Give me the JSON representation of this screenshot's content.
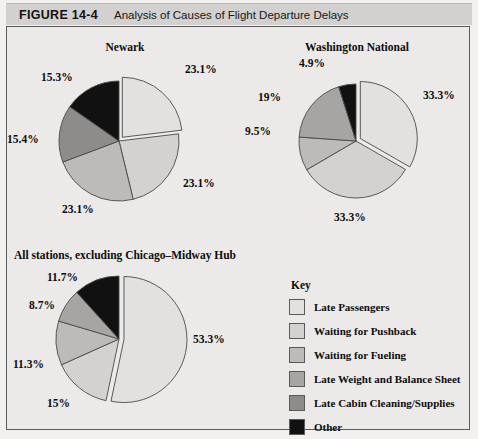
{
  "header": {
    "figure_number": "FIGURE 14-4",
    "title": "Analysis of Causes of Flight Departure Delays"
  },
  "legend": {
    "title": "Key",
    "items": [
      {
        "label": "Late Passengers",
        "color": "#e2e1df"
      },
      {
        "label": "Waiting for Pushback",
        "color": "#d3d2d0"
      },
      {
        "label": "Waiting for Fueling",
        "color": "#bcbbb9"
      },
      {
        "label": "Late Weight and Balance Sheet",
        "color": "#a6a5a3"
      },
      {
        "label": "Late Cabin Cleaning/Supplies",
        "color": "#8d8c8a"
      },
      {
        "label": "Other",
        "color": "#111111"
      }
    ]
  },
  "chart_data": [
    {
      "type": "pie",
      "title": "Newark",
      "categories": [
        "Late Passengers",
        "Waiting for Pushback",
        "Waiting for Fueling",
        "Late Weight and Balance Sheet",
        "Late Cabin Cleaning/Supplies",
        "Other"
      ],
      "values": [
        23.1,
        23.1,
        23.1,
        0,
        15.4,
        15.3
      ],
      "labels": [
        "23.1%",
        "23.1%",
        "23.1%",
        "",
        "15.4%",
        "15.3%"
      ],
      "colors": [
        "#e2e1df",
        "#d3d2d0",
        "#bcbbb9",
        "#a6a5a3",
        "#8d8c8a",
        "#111111"
      ],
      "exploded_slice": 0,
      "unit": "%"
    },
    {
      "type": "pie",
      "title": "Washington National",
      "categories": [
        "Late Passengers",
        "Waiting for Pushback",
        "Waiting for Fueling",
        "Late Weight and Balance Sheet",
        "Late Cabin Cleaning/Supplies",
        "Other"
      ],
      "values": [
        33.3,
        33.3,
        9.5,
        19,
        0,
        4.9
      ],
      "labels": [
        "33.3%",
        "33.3%",
        "9.5%",
        "19%",
        "",
        "4.9%"
      ],
      "colors": [
        "#e2e1df",
        "#d3d2d0",
        "#bcbbb9",
        "#a6a5a3",
        "#8d8c8a",
        "#111111"
      ],
      "exploded_slice": 0,
      "unit": "%"
    },
    {
      "type": "pie",
      "title": "All stations, excluding Chicago–Midway Hub",
      "categories": [
        "Late Passengers",
        "Waiting for Pushback",
        "Waiting for Fueling",
        "Late Weight and Balance Sheet",
        "Late Cabin Cleaning/Supplies",
        "Other"
      ],
      "values": [
        53.3,
        15,
        11.3,
        8.7,
        0,
        11.7
      ],
      "labels": [
        "53.3%",
        "15%",
        "11.3%",
        "8.7%",
        "",
        "11.7%"
      ],
      "colors": [
        "#e2e1df",
        "#d3d2d0",
        "#bcbbb9",
        "#a6a5a3",
        "#8d8c8a",
        "#111111"
      ],
      "exploded_slice": 0,
      "unit": "%"
    }
  ],
  "charts_layout": [
    {
      "title_x": 118,
      "title_y": 14,
      "cx": 112,
      "cy": 114,
      "r": 60,
      "label_positions": [
        {
          "x": 178,
          "y": 36
        },
        {
          "x": 176,
          "y": 150
        },
        {
          "x": 55,
          "y": 176
        },
        null,
        {
          "x": 0,
          "y": 106
        },
        {
          "x": 34,
          "y": 44
        }
      ]
    },
    {
      "title_x": 350,
      "title_y": 14,
      "cx": 349,
      "cy": 114,
      "r": 57,
      "label_positions": [
        {
          "x": 416,
          "y": 62
        },
        {
          "x": 327,
          "y": 184
        },
        {
          "x": 238,
          "y": 98
        },
        {
          "x": 251,
          "y": 64
        },
        null,
        {
          "x": 292,
          "y": 30
        }
      ]
    },
    {
      "title_x": 118,
      "title_y": 222,
      "cx": 112,
      "cy": 312,
      "r": 63,
      "label_positions": [
        {
          "x": 186,
          "y": 306
        },
        {
          "x": 40,
          "y": 370
        },
        {
          "x": 6,
          "y": 331
        },
        {
          "x": 22,
          "y": 272
        },
        null,
        {
          "x": 40,
          "y": 244
        }
      ]
    }
  ]
}
